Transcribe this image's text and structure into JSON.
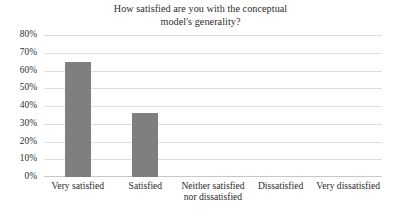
{
  "chart_data": {
    "type": "bar",
    "title": "How satisfied are you with the conceptual model's generality?",
    "title_line1": "How satisfied are you with the conceptual",
    "title_line2": "model's generality?",
    "xlabel": "",
    "ylabel": "",
    "categories": [
      "Very satisfied",
      "Satisfied",
      "Neither satisfied nor dissatisfied",
      "Dissatisfied",
      "Very dissatisfied"
    ],
    "category_lines": [
      [
        "Very satisfied",
        ""
      ],
      [
        "Satisfied",
        ""
      ],
      [
        "Neither satisfied",
        "nor dissatisfied"
      ],
      [
        "Dissatisfied",
        ""
      ],
      [
        "Very dissatisfied",
        ""
      ]
    ],
    "values": [
      65,
      36,
      0,
      0,
      0
    ],
    "value_labels": [
      "65%",
      "36%",
      "0%",
      "0%",
      "0%"
    ],
    "ylim": [
      0,
      80
    ],
    "ytick_values": [
      80,
      70,
      60,
      50,
      40,
      30,
      20,
      10,
      0
    ],
    "ytick_labels": [
      "80%",
      "70%",
      "60%",
      "50%",
      "40%",
      "30%",
      "20%",
      "10%",
      "0%"
    ],
    "grid": true,
    "legend": false,
    "legend_position": "none",
    "bar_color": "#7f7f7f",
    "gridline_color": "#dfdfdf",
    "background_color": "#ffffff",
    "text_color": "#2b2b2b"
  }
}
